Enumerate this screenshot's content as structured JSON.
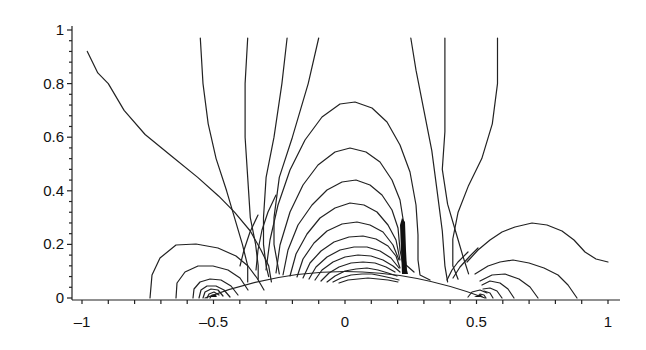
{
  "chart_data": {
    "type": "contour",
    "title": "",
    "xlabel": "",
    "ylabel": "",
    "xlim": [
      -1.05,
      1.05
    ],
    "ylim": [
      0,
      1
    ],
    "grid": false,
    "legend": null,
    "x_ticks": [
      {
        "value": -1,
        "label": "–1"
      },
      {
        "value": -0.5,
        "label": "–0.5"
      },
      {
        "value": 0,
        "label": "0"
      },
      {
        "value": 0.5,
        "label": "0.5"
      },
      {
        "value": 1,
        "label": "1"
      }
    ],
    "y_ticks": [
      {
        "value": 0,
        "label": "0"
      },
      {
        "value": 0.2,
        "label": "0.2"
      },
      {
        "value": 0.4,
        "label": "0.4"
      },
      {
        "value": 0.6,
        "label": "0.6"
      },
      {
        "value": 0.8,
        "label": "0.8"
      },
      {
        "value": 1,
        "label": "1"
      }
    ],
    "features": {
      "point_sources": [
        {
          "x": -0.5,
          "y": 0.0
        },
        {
          "x": 0.5,
          "y": 0.0
        }
      ],
      "vertical_singular_segment": {
        "x": 0.22,
        "y_from": 0.08,
        "y_to": 0.29
      },
      "lower_boundary": "circular arc from x≈-0.6 to x≈0.6, peak y≈0.1 at x=0",
      "nested_arches_centered_x": 0.15,
      "outer_arch_peak_y": 0.67
    },
    "contours": [
      {
        "id": "c1",
        "points": [
          [
            -0.98,
            0.92
          ],
          [
            -0.94,
            0.84
          ],
          [
            -0.9,
            0.8
          ],
          [
            -0.84,
            0.7
          ],
          [
            -0.76,
            0.61
          ],
          [
            -0.66,
            0.53
          ],
          [
            -0.56,
            0.45
          ],
          [
            -0.48,
            0.38
          ],
          [
            -0.42,
            0.32
          ],
          [
            -0.36,
            0.25
          ],
          [
            -0.32,
            0.18
          ],
          [
            -0.29,
            0.12
          ],
          [
            -0.28,
            0.06
          ]
        ]
      },
      {
        "id": "c2",
        "points": [
          [
            -0.55,
            0.97
          ],
          [
            -0.54,
            0.8
          ],
          [
            -0.52,
            0.65
          ],
          [
            -0.49,
            0.52
          ],
          [
            -0.45,
            0.4
          ],
          [
            -0.42,
            0.3
          ],
          [
            -0.39,
            0.2
          ],
          [
            -0.37,
            0.12
          ],
          [
            -0.37,
            0.06
          ]
        ]
      },
      {
        "id": "c3",
        "points": [
          [
            -0.37,
            0.97
          ],
          [
            -0.38,
            0.8
          ],
          [
            -0.38,
            0.6
          ],
          [
            -0.37,
            0.45
          ],
          [
            -0.36,
            0.3
          ],
          [
            -0.34,
            0.2
          ],
          [
            -0.33,
            0.12
          ],
          [
            -0.33,
            0.07
          ]
        ]
      },
      {
        "id": "c4",
        "points": [
          [
            -0.22,
            0.97
          ],
          [
            -0.24,
            0.8
          ],
          [
            -0.27,
            0.6
          ],
          [
            -0.3,
            0.45
          ],
          [
            -0.31,
            0.3
          ],
          [
            -0.31,
            0.2
          ],
          [
            -0.3,
            0.12
          ],
          [
            -0.29,
            0.08
          ]
        ]
      },
      {
        "id": "c5",
        "points": [
          [
            -0.1,
            0.97
          ],
          [
            -0.14,
            0.8
          ],
          [
            -0.2,
            0.6
          ],
          [
            -0.25,
            0.45
          ],
          [
            -0.27,
            0.3
          ],
          [
            -0.27,
            0.2
          ],
          [
            -0.25,
            0.09
          ]
        ]
      },
      {
        "id": "c6",
        "points": [
          [
            0.25,
            0.97
          ],
          [
            0.27,
            0.85
          ],
          [
            0.3,
            0.7
          ],
          [
            0.33,
            0.55
          ],
          [
            0.35,
            0.4
          ],
          [
            0.37,
            0.25
          ],
          [
            0.38,
            0.12
          ],
          [
            0.39,
            0.06
          ]
        ]
      },
      {
        "id": "c7",
        "points": [
          [
            0.38,
            0.97
          ],
          [
            0.38,
            0.8
          ],
          [
            0.38,
            0.62
          ],
          [
            0.37,
            0.48
          ],
          [
            0.39,
            0.35
          ],
          [
            0.42,
            0.25
          ],
          [
            0.45,
            0.15
          ],
          [
            0.47,
            0.09
          ]
        ]
      },
      {
        "id": "c8",
        "points": [
          [
            0.58,
            0.97
          ],
          [
            0.58,
            0.8
          ],
          [
            0.56,
            0.65
          ],
          [
            0.52,
            0.52
          ],
          [
            0.47,
            0.42
          ],
          [
            0.43,
            0.32
          ],
          [
            0.41,
            0.22
          ],
          [
            0.41,
            0.12
          ],
          [
            0.43,
            0.07
          ]
        ]
      }
    ]
  }
}
